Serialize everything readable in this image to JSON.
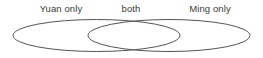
{
  "figure": {
    "type": "venn-diagram",
    "background_color": "#ffffff",
    "stroke_color": "#555555",
    "stroke_width": 1,
    "text_color": "#3a3a3a"
  },
  "labels": {
    "left": "Yuan only",
    "middle": "both",
    "right": "Ming only"
  },
  "chart_data": {
    "type": "venn",
    "title": "",
    "sets": [
      {
        "name": "Yuan",
        "region_label": "Yuan only"
      },
      {
        "name": "Ming",
        "region_label": "Ming only"
      }
    ],
    "regions": [
      {
        "id": "left-only",
        "label": "Yuan only",
        "label_x": 61,
        "label_y": 8
      },
      {
        "id": "intersection",
        "label": "both",
        "label_x": 131,
        "label_y": 8
      },
      {
        "id": "right-only",
        "label": "Ming only",
        "label_x": 210,
        "label_y": 8
      }
    ],
    "shapes": [
      {
        "id": "left-ellipse",
        "cx": 96.5,
        "cy": 35.5,
        "rx": 83.5,
        "ry": 16
      },
      {
        "id": "right-ellipse",
        "cx": 169,
        "cy": 35.5,
        "rx": 81,
        "ry": 16
      }
    ]
  }
}
